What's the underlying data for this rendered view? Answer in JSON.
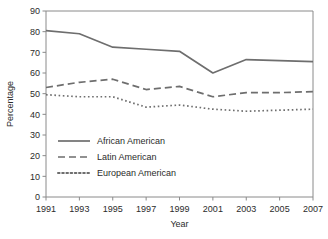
{
  "chart_data": {
    "type": "line",
    "title": "",
    "xlabel": "Year",
    "ylabel": "Percentage",
    "x": [
      1991,
      1993,
      1995,
      1997,
      1999,
      2001,
      2003,
      2005,
      2007
    ],
    "xtick_labels": [
      "1991",
      "1993",
      "1995",
      "1997",
      "1999",
      "2001",
      "2003",
      "2005",
      "2007"
    ],
    "ytick_labels": [
      "0",
      "10",
      "20",
      "30",
      "40",
      "50",
      "60",
      "70",
      "80",
      "90"
    ],
    "yticks": [
      0,
      10,
      20,
      30,
      40,
      50,
      60,
      70,
      80,
      90
    ],
    "xlim": [
      1991,
      2007
    ],
    "ylim": [
      0,
      90
    ],
    "grid": false,
    "legend_position": "inside-lower-left",
    "series": [
      {
        "name": "African American",
        "style": "solid",
        "color": "#6e6e6e",
        "values": [
          80.5,
          79.0,
          72.5,
          71.5,
          70.5,
          60.0,
          66.5,
          66.0,
          65.5
        ]
      },
      {
        "name": "Latin American",
        "style": "dashed",
        "color": "#6e6e6e",
        "values": [
          53.0,
          55.5,
          57.0,
          52.0,
          53.5,
          48.5,
          50.5,
          50.5,
          51.0
        ]
      },
      {
        "name": "European American",
        "style": "dotted",
        "color": "#6e6e6e",
        "values": [
          49.5,
          48.5,
          48.5,
          43.5,
          44.5,
          42.5,
          41.5,
          42.0,
          42.5
        ]
      }
    ]
  },
  "legend": {
    "items": [
      {
        "label": "African American",
        "style": "solid"
      },
      {
        "label": "Latin American",
        "style": "dashed"
      },
      {
        "label": "European American",
        "style": "dotted"
      }
    ]
  },
  "axes": {
    "y_title": "Percentage",
    "x_title": "Year"
  }
}
